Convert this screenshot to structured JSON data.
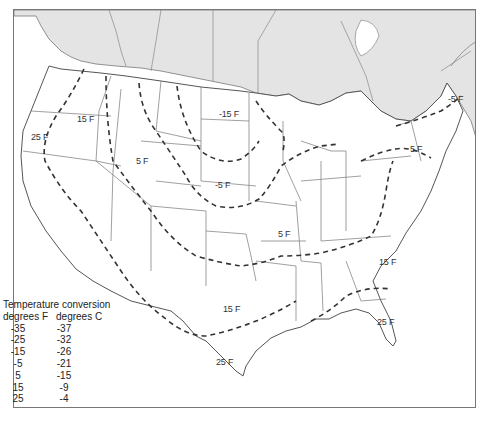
{
  "map": {
    "type": "isotherm-map",
    "region": "United States and southern Canada",
    "colors": {
      "canada_fill": "#e4e4e4",
      "us_fill": "#ffffff",
      "border": "#666666",
      "isotherm": "#333333"
    },
    "isotherm_labels": [
      {
        "id": "wa-25",
        "text": "25 F",
        "x": 30,
        "y": 131
      },
      {
        "id": "or-15",
        "text": "15 F",
        "x": 76,
        "y": 113
      },
      {
        "id": "wy-5",
        "text": "5 F",
        "x": 135,
        "y": 155
      },
      {
        "id": "nd-m15",
        "text": "-15 F",
        "x": 218,
        "y": 108
      },
      {
        "id": "ne-m5",
        "text": "-5 F",
        "x": 214,
        "y": 179
      },
      {
        "id": "mo-5",
        "text": "5 F",
        "x": 277,
        "y": 228
      },
      {
        "id": "me-m5",
        "text": "-5 F",
        "x": 447,
        "y": 93
      },
      {
        "id": "ny-5",
        "text": "5 F",
        "x": 409,
        "y": 143
      },
      {
        "id": "nc-15",
        "text": "15 F",
        "x": 378,
        "y": 256
      },
      {
        "id": "tx-15",
        "text": "15 F",
        "x": 222,
        "y": 303
      },
      {
        "id": "ga-25",
        "text": "25 F",
        "x": 376,
        "y": 316
      },
      {
        "id": "tx-25",
        "text": "25 F",
        "x": 215,
        "y": 356
      }
    ]
  },
  "legend": {
    "title": "Temperature conversion",
    "col_f": "degrees F",
    "col_c": "degrees C",
    "rows": [
      {
        "f": "-35",
        "c": "-37"
      },
      {
        "f": "-25",
        "c": "-32"
      },
      {
        "f": "-15",
        "c": "-26"
      },
      {
        "f": "-5",
        "c": "-21"
      },
      {
        "f": "5",
        "c": "-15"
      },
      {
        "f": "15",
        "c": "-9"
      },
      {
        "f": "25",
        "c": "-4"
      }
    ]
  }
}
